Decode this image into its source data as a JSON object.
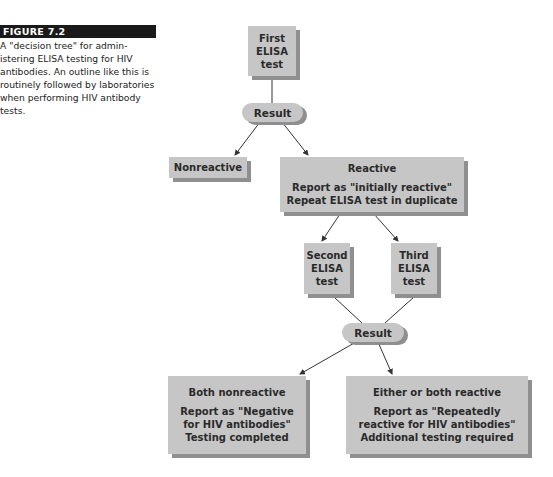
{
  "caption": {
    "figure_label": "FIGURE 7.2",
    "text": "A \"decision tree\" for admin-istering ELISA testing for HIV antibodies. An outline like this is routinely followed by laboratories when performing HIV antibody tests."
  },
  "nodes": {
    "first_test": {
      "line1": "First",
      "line2": "ELISA",
      "line3": "test"
    },
    "result1": "Result",
    "nonreactive": "Nonreactive",
    "reactive": {
      "title": "Reactive",
      "line1": "Report as \"initially reactive\"",
      "line2": "Repeat ELISA test in duplicate"
    },
    "second_test": {
      "line1": "Second",
      "line2": "ELISA",
      "line3": "test"
    },
    "third_test": {
      "line1": "Third",
      "line2": "ELISA",
      "line3": "test"
    },
    "result2": "Result",
    "both_nonreactive": {
      "title": "Both nonreactive",
      "line1": "Report as \"Negative",
      "line2": "for HIV antibodies\"",
      "line3": "Testing completed"
    },
    "either_reactive": {
      "title": "Either or both reactive",
      "line1": "Report as \"Repeatedly",
      "line2": "reactive for HIV antibodies\"",
      "line3": "Additional testing required"
    }
  },
  "colors": {
    "box_fill": "#c6c6c6",
    "box_shadow": "#8f8f8f",
    "label_bg": "#1a1a1a",
    "line": "#333333"
  }
}
